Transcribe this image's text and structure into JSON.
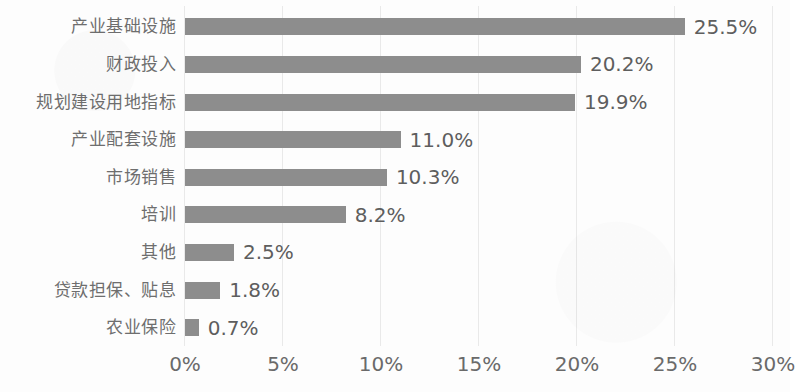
{
  "chart_data": {
    "type": "bar",
    "orientation": "horizontal",
    "title": "",
    "subtitle": "",
    "xlabel": "",
    "ylabel": "",
    "xlim": [
      0,
      30
    ],
    "xtick_labels": [
      "0%",
      "5%",
      "10%",
      "15%",
      "20%",
      "25%",
      "30%"
    ],
    "xtick_values": [
      0,
      5,
      10,
      15,
      20,
      25,
      30
    ],
    "grid": true,
    "grid_axis": "x",
    "legend": false,
    "legend_position": "none",
    "bar_color": "#8d8d8d",
    "text_color": "#6a6a6a",
    "categories": [
      "产业基础设施",
      "财政投入",
      "规划建设用地指标",
      "产业配套设施",
      "市场销售",
      "培训",
      "其他",
      "贷款担保、贴息",
      "农业保险"
    ],
    "values": [
      25.5,
      20.2,
      19.9,
      11.0,
      10.3,
      8.2,
      2.5,
      1.8,
      0.7
    ],
    "data_labels": [
      "25.5%",
      "20.2%",
      "19.9%",
      "11.0%",
      "10.3%",
      "8.2%",
      "2.5%",
      "1.8%",
      "0.7%"
    ]
  }
}
